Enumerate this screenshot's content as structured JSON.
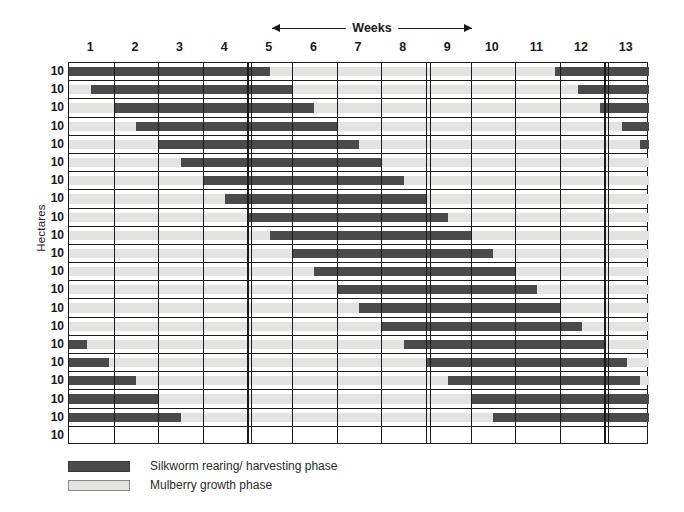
{
  "chart_data": {
    "type": "bar",
    "subtype": "gantt-staggered-timeline",
    "title": "",
    "xlabel": "Weeks",
    "ylabel": "Hectares",
    "xlim": [
      0,
      13
    ],
    "ylim": [
      0,
      21
    ],
    "grid": true,
    "legend_position": "below-left",
    "x_tick_labels": [
      "1",
      "2",
      "3",
      "4",
      "5",
      "6",
      "7",
      "8",
      "9",
      "10",
      "11",
      "12",
      "13"
    ],
    "x_tick_positions": [
      0.5,
      1.5,
      2.5,
      3.5,
      4.5,
      5.5,
      6.5,
      7.5,
      8.5,
      9.5,
      10.5,
      11.5,
      12.5
    ],
    "major_separator_weeks": [
      4.5,
      8.5,
      12.5
    ],
    "y_tick_labels": [
      "10",
      "10",
      "10",
      "10",
      "10",
      "10",
      "10",
      "10",
      "10",
      "10",
      "10",
      "10",
      "10",
      "10",
      "10",
      "10",
      "10",
      "10",
      "10",
      "10",
      "10"
    ],
    "series": [
      {
        "name": "Silkworm rearing/ harvesting phase",
        "color": "#4a4a4a",
        "key": "silkworm"
      },
      {
        "name": "Mulberry growth phase",
        "color": "#e3e3e1",
        "key": "mulberry"
      }
    ],
    "rows": [
      {
        "label": "10",
        "segments": [
          {
            "phase": "silkworm",
            "start": 0.0,
            "end": 4.5
          },
          {
            "phase": "mulberry",
            "start": 4.5,
            "end": 10.9
          },
          {
            "phase": "silkworm",
            "start": 10.9,
            "end": 13.0
          }
        ]
      },
      {
        "label": "10",
        "segments": [
          {
            "phase": "mulberry",
            "start": 0.0,
            "end": 0.5
          },
          {
            "phase": "silkworm",
            "start": 0.5,
            "end": 5.0
          },
          {
            "phase": "mulberry",
            "start": 5.0,
            "end": 11.4
          },
          {
            "phase": "silkworm",
            "start": 11.4,
            "end": 13.0
          }
        ]
      },
      {
        "label": "10",
        "segments": [
          {
            "phase": "mulberry",
            "start": 0.0,
            "end": 1.0
          },
          {
            "phase": "silkworm",
            "start": 1.0,
            "end": 5.5
          },
          {
            "phase": "mulberry",
            "start": 5.5,
            "end": 11.9
          },
          {
            "phase": "silkworm",
            "start": 11.9,
            "end": 13.0
          }
        ]
      },
      {
        "label": "10",
        "segments": [
          {
            "phase": "mulberry",
            "start": 0.0,
            "end": 1.5
          },
          {
            "phase": "silkworm",
            "start": 1.5,
            "end": 6.0
          },
          {
            "phase": "mulberry",
            "start": 6.0,
            "end": 12.4
          },
          {
            "phase": "silkworm",
            "start": 12.4,
            "end": 13.0
          }
        ]
      },
      {
        "label": "10",
        "segments": [
          {
            "phase": "mulberry",
            "start": 0.0,
            "end": 2.0
          },
          {
            "phase": "silkworm",
            "start": 2.0,
            "end": 6.5
          },
          {
            "phase": "mulberry",
            "start": 6.5,
            "end": 12.8
          },
          {
            "phase": "silkworm",
            "start": 12.8,
            "end": 13.0
          }
        ]
      },
      {
        "label": "10",
        "segments": [
          {
            "phase": "mulberry",
            "start": 0.0,
            "end": 2.5
          },
          {
            "phase": "silkworm",
            "start": 2.5,
            "end": 7.0
          },
          {
            "phase": "mulberry",
            "start": 7.0,
            "end": 13.0
          }
        ]
      },
      {
        "label": "10",
        "segments": [
          {
            "phase": "mulberry",
            "start": 0.0,
            "end": 3.0
          },
          {
            "phase": "silkworm",
            "start": 3.0,
            "end": 7.5
          },
          {
            "phase": "mulberry",
            "start": 7.5,
            "end": 13.0
          }
        ]
      },
      {
        "label": "10",
        "segments": [
          {
            "phase": "mulberry",
            "start": 0.0,
            "end": 3.5
          },
          {
            "phase": "silkworm",
            "start": 3.5,
            "end": 8.0
          },
          {
            "phase": "mulberry",
            "start": 8.0,
            "end": 13.0
          }
        ]
      },
      {
        "label": "10",
        "segments": [
          {
            "phase": "mulberry",
            "start": 0.0,
            "end": 4.0
          },
          {
            "phase": "silkworm",
            "start": 4.0,
            "end": 8.5
          },
          {
            "phase": "mulberry",
            "start": 8.5,
            "end": 13.0
          }
        ]
      },
      {
        "label": "10",
        "segments": [
          {
            "phase": "mulberry",
            "start": 0.0,
            "end": 4.5
          },
          {
            "phase": "silkworm",
            "start": 4.5,
            "end": 9.0
          },
          {
            "phase": "mulberry",
            "start": 9.0,
            "end": 13.0
          }
        ]
      },
      {
        "label": "10",
        "segments": [
          {
            "phase": "mulberry",
            "start": 0.0,
            "end": 5.0
          },
          {
            "phase": "silkworm",
            "start": 5.0,
            "end": 9.5
          },
          {
            "phase": "mulberry",
            "start": 9.5,
            "end": 13.0
          }
        ]
      },
      {
        "label": "10",
        "segments": [
          {
            "phase": "mulberry",
            "start": 0.0,
            "end": 5.5
          },
          {
            "phase": "silkworm",
            "start": 5.5,
            "end": 10.0
          },
          {
            "phase": "mulberry",
            "start": 10.0,
            "end": 13.0
          }
        ]
      },
      {
        "label": "10",
        "segments": [
          {
            "phase": "mulberry",
            "start": 0.0,
            "end": 6.0
          },
          {
            "phase": "silkworm",
            "start": 6.0,
            "end": 10.5
          },
          {
            "phase": "mulberry",
            "start": 10.5,
            "end": 13.0
          }
        ]
      },
      {
        "label": "10",
        "segments": [
          {
            "phase": "mulberry",
            "start": 0.0,
            "end": 6.5
          },
          {
            "phase": "silkworm",
            "start": 6.5,
            "end": 11.0
          },
          {
            "phase": "mulberry",
            "start": 11.0,
            "end": 13.0
          }
        ]
      },
      {
        "label": "10",
        "segments": [
          {
            "phase": "mulberry",
            "start": 0.0,
            "end": 7.0
          },
          {
            "phase": "silkworm",
            "start": 7.0,
            "end": 11.5
          },
          {
            "phase": "mulberry",
            "start": 11.5,
            "end": 13.0
          }
        ]
      },
      {
        "label": "10",
        "segments": [
          {
            "phase": "silkworm",
            "start": 0.0,
            "end": 0.4
          },
          {
            "phase": "mulberry",
            "start": 0.4,
            "end": 7.5
          },
          {
            "phase": "silkworm",
            "start": 7.5,
            "end": 12.0
          },
          {
            "phase": "mulberry",
            "start": 12.0,
            "end": 13.0
          }
        ]
      },
      {
        "label": "10",
        "segments": [
          {
            "phase": "silkworm",
            "start": 0.0,
            "end": 0.9
          },
          {
            "phase": "mulberry",
            "start": 0.9,
            "end": 8.0
          },
          {
            "phase": "silkworm",
            "start": 8.0,
            "end": 12.5
          },
          {
            "phase": "mulberry",
            "start": 12.5,
            "end": 13.0
          }
        ]
      },
      {
        "label": "10",
        "segments": [
          {
            "phase": "silkworm",
            "start": 0.0,
            "end": 1.5
          },
          {
            "phase": "mulberry",
            "start": 1.5,
            "end": 8.5
          },
          {
            "phase": "silkworm",
            "start": 8.5,
            "end": 12.8
          },
          {
            "phase": "mulberry",
            "start": 12.8,
            "end": 13.0
          }
        ]
      },
      {
        "label": "10",
        "segments": [
          {
            "phase": "silkworm",
            "start": 0.0,
            "end": 2.0
          },
          {
            "phase": "mulberry",
            "start": 2.0,
            "end": 9.0
          },
          {
            "phase": "silkworm",
            "start": 9.0,
            "end": 13.0
          }
        ]
      },
      {
        "label": "10",
        "segments": [
          {
            "phase": "silkworm",
            "start": 0.0,
            "end": 2.5
          },
          {
            "phase": "mulberry",
            "start": 2.5,
            "end": 9.5
          },
          {
            "phase": "silkworm",
            "start": 9.5,
            "end": 13.0
          }
        ]
      },
      {
        "label": "10",
        "segments": [
          {
            "phase": "mulberry",
            "start": 0.0,
            "end": 0.0
          }
        ]
      }
    ]
  },
  "header": {
    "weeks_label": "Weeks",
    "arrow_left": "left-arrow-icon",
    "arrow_right": "right-arrow-icon"
  },
  "axes": {
    "y_title": "Hectares"
  },
  "legend": {
    "items": [
      {
        "label": "Silkworm rearing/ harvesting phase",
        "swatch": "silkworm",
        "color": "#4a4a4a"
      },
      {
        "label": "Mulberry growth phase",
        "swatch": "mulberry",
        "color": "#e3e3e1"
      }
    ]
  },
  "colors": {
    "silkworm": "#4a4a4a",
    "mulberry": "#e3e3e1",
    "axis": "#1a1a1a",
    "background": "#ffffff"
  }
}
